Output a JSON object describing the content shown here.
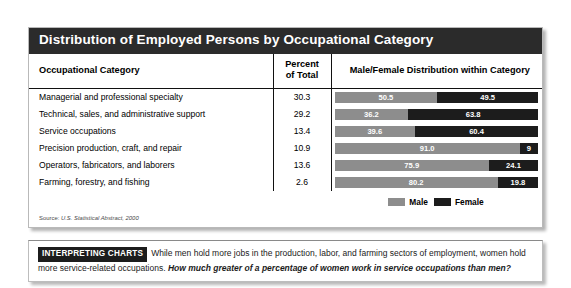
{
  "panel": {
    "title": "Distribution of Employed Persons by Occupational Category",
    "columns": {
      "category": "Occupational Category",
      "percent_line1": "Percent",
      "percent_line2": "of Total",
      "distribution": "Male/Female Distribution within Category"
    },
    "legend": {
      "male": "Male",
      "female": "Female"
    },
    "source": {
      "label": "Source:",
      "text": "U.S. Statistical Abstract, 2000"
    }
  },
  "interpreting": {
    "tag": "INTERPRETING CHARTS",
    "body": "While men hold more jobs in the production, labor, and farming sectors of employment, women hold more service-related occupations.",
    "question": "How much greater of a percentage of women work in service occupations than men?"
  },
  "chart_data": {
    "type": "bar",
    "title": "Distribution of Employed Persons by Occupational Category",
    "subtitle": "",
    "xlabel": "",
    "ylabel": "",
    "stacked": true,
    "orientation": "horizontal",
    "xlim": [
      0,
      100
    ],
    "grid": false,
    "legend_position": "bottom",
    "categories": [
      "Managerial and professional specialty",
      "Technical, sales, and administrative support",
      "Service occupations",
      "Precision production, craft, and repair",
      "Operators, fabricators, and laborers",
      "Farming, forestry, and fishing"
    ],
    "percent_of_total": [
      "30.3",
      "29.2",
      "13.4",
      "10.9",
      "13.6",
      "2.6"
    ],
    "series": [
      {
        "name": "Male",
        "color": "#8d8d8d",
        "values": [
          50.5,
          36.2,
          39.6,
          91.0,
          75.9,
          80.2
        ],
        "labels": [
          "50.5",
          "36.2",
          "39.6",
          "91.0",
          "75.9",
          "80.2"
        ]
      },
      {
        "name": "Female",
        "color": "#1c1c1c",
        "values": [
          49.5,
          63.8,
          60.4,
          9.0,
          24.1,
          19.8
        ],
        "labels": [
          "49.5",
          "63.8",
          "60.4",
          "9",
          "24.1",
          "19.8"
        ]
      }
    ],
    "rows": [
      {
        "category": "Managerial and professional specialty",
        "percent_of_total": "30.3",
        "male": 50.5,
        "male_label": "50.5",
        "female": 49.5,
        "female_label": "49.5"
      },
      {
        "category": "Technical, sales, and administrative support",
        "percent_of_total": "29.2",
        "male": 36.2,
        "male_label": "36.2",
        "female": 63.8,
        "female_label": "63.8"
      },
      {
        "category": "Service occupations",
        "percent_of_total": "13.4",
        "male": 39.6,
        "male_label": "39.6",
        "female": 60.4,
        "female_label": "60.4"
      },
      {
        "category": "Precision production, craft, and repair",
        "percent_of_total": "10.9",
        "male": 91.0,
        "male_label": "91.0",
        "female": 9.0,
        "female_label": "9"
      },
      {
        "category": "Operators, fabricators, and laborers",
        "percent_of_total": "13.6",
        "male": 75.9,
        "male_label": "75.9",
        "female": 24.1,
        "female_label": "24.1"
      },
      {
        "category": "Farming, forestry, and fishing",
        "percent_of_total": "2.6",
        "male": 80.2,
        "male_label": "80.2",
        "female": 19.8,
        "female_label": "19.8"
      }
    ]
  }
}
